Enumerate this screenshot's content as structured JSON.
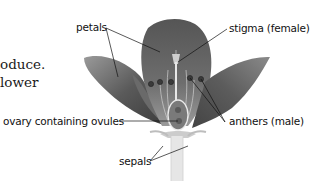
{
  "body_text": {
    "line1": "oduce.",
    "line2": "lower"
  },
  "diagram": {
    "labels": {
      "petals": "petals",
      "stigma": "stigma (female)",
      "ovary": "ovary containing ovules",
      "anthers": "anthers (male)",
      "sepals": "sepals"
    }
  }
}
